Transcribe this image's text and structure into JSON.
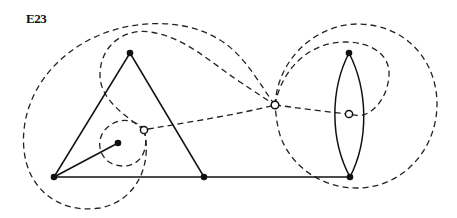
{
  "figure": {
    "label": "E23",
    "colors": {
      "stroke": "#111111",
      "background": "#ffffff"
    }
  },
  "vertices": [
    {
      "id": "triangle-top",
      "x": 130,
      "y": 53
    },
    {
      "id": "bottom-left",
      "x": 54,
      "y": 177
    },
    {
      "id": "bottom-middle",
      "x": 204,
      "y": 177
    },
    {
      "id": "inner-dot",
      "x": 118,
      "y": 143
    },
    {
      "id": "lens-top",
      "x": 349,
      "y": 53
    },
    {
      "id": "lens-bottom",
      "x": 350,
      "y": 177
    }
  ],
  "dual_vertices": [
    {
      "id": "dual-small-face",
      "x": 144,
      "y": 130
    },
    {
      "id": "dual-outer-face",
      "x": 275,
      "y": 105
    },
    {
      "id": "dual-lens-face",
      "x": 349,
      "y": 114
    }
  ],
  "solid_edges": [
    {
      "id": "triangle-left-side",
      "from": "triangle-top",
      "to": "bottom-left"
    },
    {
      "id": "triangle-right-side",
      "from": "triangle-top",
      "to": "bottom-middle"
    },
    {
      "id": "bottom-base",
      "from": "bottom-left",
      "to": "lens-bottom"
    },
    {
      "id": "pendant-edge",
      "from": "bottom-left",
      "to": "inner-dot"
    },
    {
      "id": "lens-left-arc",
      "from": "lens-top",
      "to": "lens-bottom"
    },
    {
      "id": "lens-right-arc",
      "from": "lens-top",
      "to": "lens-bottom"
    }
  ],
  "dashed_edges": [
    {
      "id": "small-loop"
    },
    {
      "id": "big-left-loop"
    },
    {
      "id": "dual-edge-small-to-outer"
    },
    {
      "id": "upper-curve-outer"
    },
    {
      "id": "upper-curve-inner"
    },
    {
      "id": "large-right-circle"
    },
    {
      "id": "lens-loop"
    },
    {
      "id": "dual-edge-outer-to-lens"
    }
  ]
}
